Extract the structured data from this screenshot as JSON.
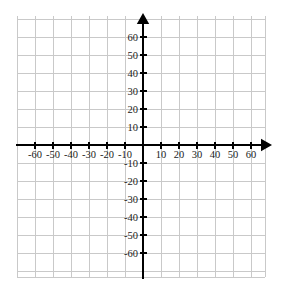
{
  "graph": {
    "title": "",
    "background_color": "#ffffff",
    "grid_color": "#c9c9c9",
    "axis_color": "#000000",
    "label_color": "#1a1a1a"
  },
  "chart_data": {
    "type": "scatter",
    "title": "",
    "subtitle": "",
    "xlabel": "",
    "ylabel": "",
    "xlim": [
      -70,
      70
    ],
    "ylim": [
      -70,
      70
    ],
    "grid": true,
    "grid_step": 10,
    "legend": null,
    "legend_position": "none",
    "series": [],
    "x": [],
    "values": [],
    "annotations": [],
    "x_tick_labels": [
      "-60",
      "-50",
      "-40",
      "-30",
      "-20",
      "-10",
      "10",
      "20",
      "30",
      "40",
      "50",
      "60"
    ],
    "x_tick_values": [
      -60,
      -50,
      -40,
      -30,
      -20,
      -10,
      10,
      20,
      30,
      40,
      50,
      60
    ],
    "y_tick_labels": [
      "60",
      "50",
      "40",
      "30",
      "20",
      "10",
      "-10",
      "-20",
      "-30",
      "-40",
      "-50",
      "-60"
    ],
    "y_tick_values": [
      60,
      50,
      40,
      30,
      20,
      10,
      -10,
      -20,
      -30,
      -40,
      -50,
      -60
    ],
    "x_axis_arrow": "right",
    "y_axis_arrow": "up"
  },
  "axes": {
    "x_axis_name": "x-axis",
    "y_axis_name": "y-axis",
    "origin_label": ""
  }
}
